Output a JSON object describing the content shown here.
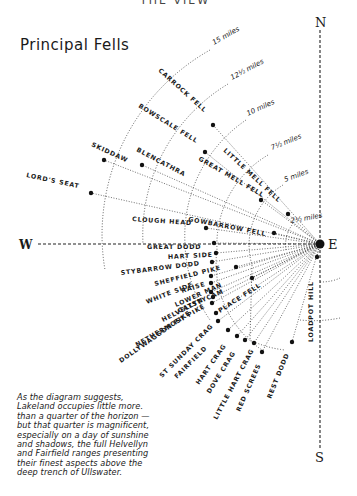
{
  "page": {
    "header_fragment": "THE VIEW",
    "title": "Principal Fells",
    "caption_lines": [
      "As the diagram suggests,",
      "Lakeland occupies little more.",
      "than a quarter of the horizon —",
      "but that quarter is magnificent,",
      "especially on a day of sunshine",
      "and shadows, the full Helvellyn",
      "and Fairfield ranges presenting",
      "their finest aspects above the",
      "deep trench of Ullswater."
    ]
  },
  "compass": {
    "north": "N",
    "south": "S",
    "west": "W",
    "east": "E"
  },
  "distance_rings": [
    {
      "label": "2½ miles",
      "x": 291,
      "y": 223,
      "rot": -10
    },
    {
      "label": "5 miles",
      "x": 285,
      "y": 182,
      "rot": -20
    },
    {
      "label": "7½ miles",
      "x": 272,
      "y": 150,
      "rot": -22
    },
    {
      "label": "10 miles",
      "x": 248,
      "y": 116,
      "rot": -25
    },
    {
      "label": "12½ miles",
      "x": 232,
      "y": 80,
      "rot": -28
    },
    {
      "label": "15 miles",
      "x": 214,
      "y": 45,
      "rot": -30
    }
  ],
  "fells": [
    {
      "name": "LORD'S SEAT",
      "dot": [
        91,
        193
      ],
      "label": [
        26,
        177
      ],
      "rot": 12
    },
    {
      "name": "SKIDDAW",
      "dot": [
        104,
        160
      ],
      "label": [
        91,
        146
      ],
      "rot": 25
    },
    {
      "name": "BLENCATHRA",
      "dot": [
        142,
        165
      ],
      "label": [
        136,
        151
      ],
      "rot": 28
    },
    {
      "name": "BOWSCALE FELL",
      "dot": [
        205,
        152
      ],
      "label": [
        138,
        107
      ],
      "rot": 32
    },
    {
      "name": "CARROCK FELL",
      "dot": [
        213,
        125
      ],
      "label": [
        158,
        71
      ],
      "rot": 42
    },
    {
      "name": "GREAT MELL FELL",
      "dot": [
        261,
        200
      ],
      "label": [
        198,
        160
      ],
      "rot": 30
    },
    {
      "name": "LITTLE MELL FELL",
      "dot": [
        288,
        214
      ],
      "label": [
        223,
        151
      ],
      "rot": 43
    },
    {
      "name": "GOWBARROW FELL",
      "dot": [
        274,
        233
      ],
      "label": [
        188,
        221
      ],
      "rot": 11
    },
    {
      "name": "CLOUGH HEAD",
      "dot": [
        206,
        228
      ],
      "label": [
        132,
        221
      ],
      "rot": 4
    },
    {
      "name": "GREAT DODD",
      "dot": [
        214,
        243
      ],
      "label": [
        147,
        249
      ],
      "rot": 0
    },
    {
      "name": "HART SIDE",
      "dot": [
        216,
        253
      ],
      "label": [
        168,
        259
      ],
      "rot": -3
    },
    {
      "name": "STYBARROW DODD",
      "dot": [
        212,
        262
      ],
      "label": [
        121,
        275
      ],
      "rot": -7
    },
    {
      "name": "SHEFFIELD PIKE",
      "dot": [
        236,
        267
      ],
      "label": [
        155,
        286
      ],
      "rot": -14
    },
    {
      "name": "RAISE",
      "dot": [
        211,
        276
      ],
      "label": [
        182,
        293
      ],
      "rot": -17
    },
    {
      "name": "WHITE SIDE",
      "dot": [
        211,
        283
      ],
      "label": [
        147,
        304
      ],
      "rot": -21
    },
    {
      "name": "LOWER MAN",
      "dot": [
        211,
        292
      ],
      "label": [
        176,
        307
      ],
      "rot": -24
    },
    {
      "name": "CATSTYCAM",
      "dot": [
        213,
        297
      ],
      "label": [
        179,
        313
      ],
      "rot": -24
    },
    {
      "name": "HELVELLYN",
      "dot": [
        212,
        303
      ],
      "label": [
        163,
        322
      ],
      "rot": -27
    },
    {
      "name": "HELVELLYN LOWER MAN",
      "dot": [
        0,
        0
      ],
      "label": [
        0,
        0
      ],
      "rot": 0,
      "hidden": true
    },
    {
      "name": "NETHERMOST PIKE",
      "dot": [
        216,
        313
      ],
      "label": [
        137,
        347
      ],
      "rot": -30
    },
    {
      "name": "PLACE FELL",
      "dot": [
        252,
        278
      ],
      "label": [
        220,
        313
      ],
      "rot": -33
    },
    {
      "name": "DOLLYWAGGON PIKE",
      "dot": [
        218,
        321
      ],
      "label": [
        121,
        363
      ],
      "rot": -35
    },
    {
      "name": "ST SUNDAY CRAG",
      "dot": [
        228,
        330
      ],
      "label": [
        162,
        378
      ],
      "rot": -45
    },
    {
      "name": "FAIRFIELD",
      "dot": [
        237,
        336
      ],
      "label": [
        177,
        379
      ],
      "rot": -45
    },
    {
      "name": "HART CRAG",
      "dot": [
        245,
        340
      ],
      "label": [
        199,
        385
      ],
      "rot": -55
    },
    {
      "name": "DOVE CRAG",
      "dot": [
        254,
        343
      ],
      "label": [
        210,
        394
      ],
      "rot": -58
    },
    {
      "name": "LITTLE HART CRAG",
      "dot": [
        262,
        352
      ],
      "label": [
        217,
        420
      ],
      "rot": -62
    },
    {
      "name": "RED SCREES",
      "dot": [
        0,
        0
      ],
      "label": [
        240,
        412
      ],
      "rot": -66,
      "nodot": true
    },
    {
      "name": "REST DODD",
      "dot": [
        292,
        342
      ],
      "label": [
        271,
        399
      ],
      "rot": -68
    },
    {
      "name": "LOADPOT HILL",
      "dot": [
        317,
        257
      ],
      "label": [
        313,
        342
      ],
      "rot": -90
    }
  ]
}
